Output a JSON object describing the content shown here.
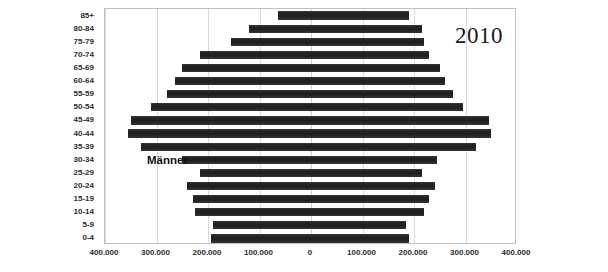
{
  "chart_data": {
    "type": "bar",
    "subtype": "population-pyramid",
    "title": "",
    "annotation_year": "2010",
    "xlabel": "",
    "ylabel": "",
    "grid": true,
    "legend_position": "inside-plot",
    "left_series_label": "Männer",
    "right_series_label": "Frauen",
    "categories": [
      "0-4",
      "5-9",
      "10-14",
      "15-19",
      "20-24",
      "25-29",
      "30-34",
      "35-39",
      "40-44",
      "45-49",
      "50-54",
      "55-59",
      "60-64",
      "65-69",
      "70-74",
      "75-79",
      "80-84",
      "85+"
    ],
    "categories_top_to_bottom": [
      "85+",
      "80-84",
      "75-79",
      "70-74",
      "65-69",
      "60-64",
      "55-59",
      "50-54",
      "45-49",
      "40-44",
      "35-39",
      "30-34",
      "25-29",
      "20-24",
      "15-19",
      "10-14",
      "5-9",
      "0-4"
    ],
    "xlim": [
      -400000,
      400000
    ],
    "x_tick_values": [
      -400000,
      -300000,
      -200000,
      -100000,
      0,
      100000,
      200000,
      300000,
      400000
    ],
    "x_tick_labels": [
      "400.000",
      "300.000",
      "200.000",
      "100.000",
      "0",
      "100.000",
      "200.000",
      "300.000",
      "400.000"
    ],
    "series": [
      {
        "name": "Männer",
        "side": "left",
        "values_top_to_bottom": [
          65000,
          120000,
          155000,
          215000,
          250000,
          265000,
          280000,
          310000,
          350000,
          355000,
          330000,
          250000,
          215000,
          240000,
          230000,
          225000,
          190000,
          195000
        ]
      },
      {
        "name": "Frauen",
        "side": "right",
        "values_top_to_bottom": [
          190000,
          215000,
          220000,
          230000,
          250000,
          260000,
          275000,
          295000,
          345000,
          350000,
          320000,
          245000,
          215000,
          240000,
          230000,
          220000,
          185000,
          190000
        ]
      }
    ],
    "bar_color": "#262626"
  },
  "plot": {
    "gridline_color": "#d9d9d9",
    "border_color": "#bfbfbf",
    "background": "#ffffff"
  }
}
